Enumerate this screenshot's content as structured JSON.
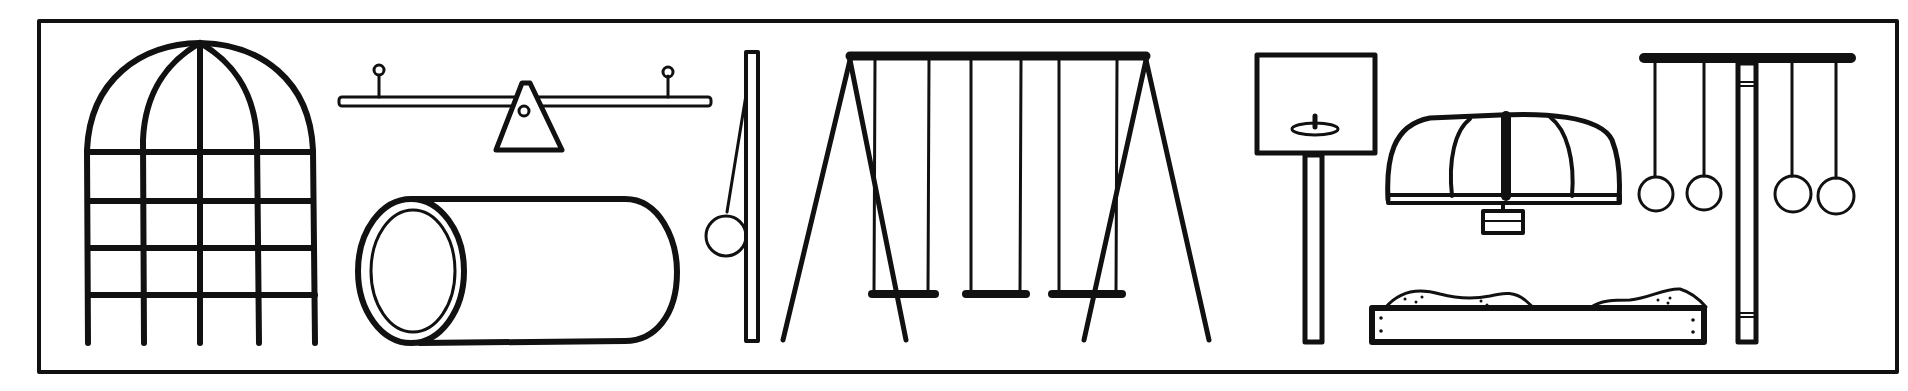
{
  "illustration": {
    "subject": "playground equipment line drawing",
    "colors": {
      "ink": "#111111",
      "background": "#ffffff"
    },
    "items": [
      {
        "name": "dome-climber",
        "label": "Dome climber"
      },
      {
        "name": "seesaw",
        "label": "Seesaw"
      },
      {
        "name": "crawl-tunnel",
        "label": "Crawl tunnel"
      },
      {
        "name": "tetherball",
        "label": "Tetherball"
      },
      {
        "name": "swing-set",
        "label": "Swing set",
        "swing_count": 3
      },
      {
        "name": "basketball-hoop",
        "label": "Basketball hoop"
      },
      {
        "name": "merry-go-round",
        "label": "Merry-go-round"
      },
      {
        "name": "sandbox",
        "label": "Sandbox"
      },
      {
        "name": "gymnastic-rings",
        "label": "Gymnastic rings",
        "ring_count": 4
      }
    ]
  }
}
